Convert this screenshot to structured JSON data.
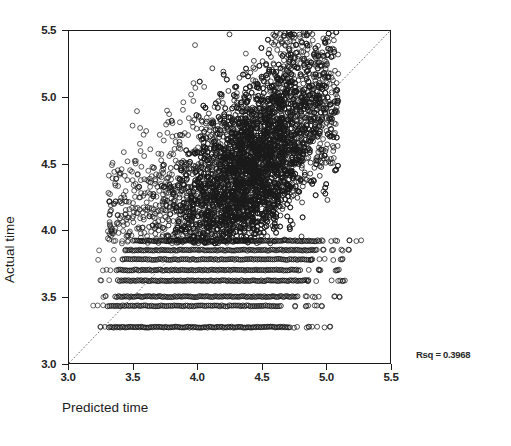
{
  "chart_data": {
    "type": "scatter",
    "title": "",
    "xlabel": "Predicted time",
    "ylabel": "Actual time",
    "xlim": [
      3.0,
      5.5
    ],
    "ylim": [
      3.0,
      5.5
    ],
    "xticks": [
      "3.0",
      "3.5",
      "4.0",
      "4.5",
      "5.0",
      "5.5"
    ],
    "yticks": [
      "3.0",
      "3.5",
      "4.0",
      "4.5",
      "5.0",
      "5.5"
    ],
    "xtick_values": [
      3.0,
      3.5,
      4.0,
      4.5,
      5.0,
      5.5
    ],
    "ytick_values": [
      3.0,
      3.5,
      4.0,
      4.5,
      5.0,
      5.5
    ],
    "grid": false,
    "legend": null,
    "marker": "open-circle",
    "marker_color": "#1a1a1a",
    "marker_size": 3.4,
    "annotations": [
      {
        "name": "rsq",
        "text": "Rsq = 0.3968",
        "value": 0.3968
      }
    ],
    "reference_line": {
      "name": "identity-line",
      "style": "dotted",
      "from": [
        3.0,
        3.0
      ],
      "to": [
        5.5,
        5.5
      ],
      "color": "#555555"
    },
    "n_points_approx": 7400,
    "discrete_bands": [
      {
        "y": 3.0,
        "x_start": 3.33,
        "x_end": 4.66,
        "density": 0.95
      },
      {
        "y": 3.27,
        "x_start": 3.31,
        "x_end": 4.72,
        "density": 1.0
      },
      {
        "y": 3.43,
        "x_start": 3.3,
        "x_end": 4.65,
        "density": 0.85
      },
      {
        "y": 3.5,
        "x_start": 3.36,
        "x_end": 4.78,
        "density": 0.92
      },
      {
        "y": 3.62,
        "x_start": 3.38,
        "x_end": 4.86,
        "density": 0.9
      },
      {
        "y": 3.7,
        "x_start": 3.37,
        "x_end": 4.8,
        "density": 0.88
      },
      {
        "y": 3.78,
        "x_start": 3.42,
        "x_end": 4.88,
        "density": 0.86
      },
      {
        "y": 3.85,
        "x_start": 3.44,
        "x_end": 4.92,
        "density": 0.9
      },
      {
        "y": 3.92,
        "x_start": 3.5,
        "x_end": 4.95,
        "density": 0.93
      }
    ],
    "cloud": {
      "x_center": 4.42,
      "y_center": 4.45,
      "x_spread": 0.3,
      "y_spread": 0.42,
      "correlation": 0.63,
      "y_max": 5.5,
      "x_min": 3.25,
      "x_max": 5.1
    }
  },
  "axes": {
    "ylabel": "Actual time",
    "xlabel": "Predicted time"
  },
  "annotation": {
    "rsq_label": "Rsq = 0.3968"
  }
}
